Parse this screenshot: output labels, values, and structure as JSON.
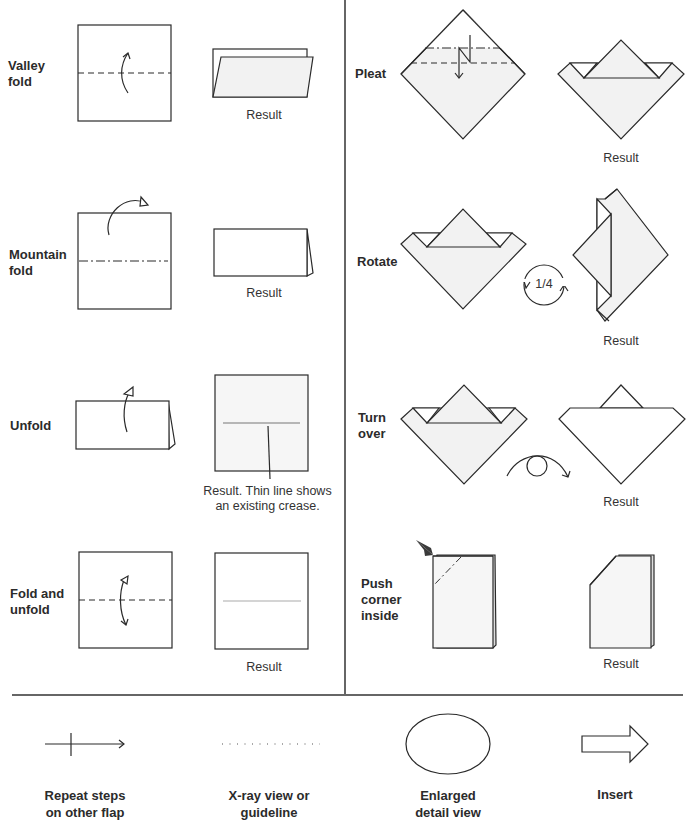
{
  "diagram": {
    "colors": {
      "ink": "#2a2a2a",
      "paper": "#ffffff",
      "colored_side": "#f2f2f2",
      "crease_line": "#aaaaaa",
      "divider": "#666666"
    },
    "left_column": [
      {
        "label": "Valley\nfold",
        "result": "Result"
      },
      {
        "label": "Mountain\nfold",
        "result": "Result"
      },
      {
        "label": "Unfold",
        "result": "Result. Thin line shows\nan existing crease."
      },
      {
        "label": "Fold and\nunfold",
        "result": "Result"
      }
    ],
    "right_column": [
      {
        "label": "Pleat",
        "result": "Result"
      },
      {
        "label": "Rotate",
        "result": "Result",
        "rotation": "1/4"
      },
      {
        "label": "Turn\nover",
        "result": "Result"
      },
      {
        "label": "Push\ncorner\ninside",
        "result": "Result"
      }
    ],
    "legend": [
      {
        "icon": "repeat-arrow-icon",
        "label": "Repeat steps\non other flap"
      },
      {
        "icon": "dotted-line-icon",
        "label": "X-ray view or\nguideline"
      },
      {
        "icon": "ellipse-icon",
        "label": "Enlarged\ndetail view"
      },
      {
        "icon": "hollow-arrow-icon",
        "label": "Insert"
      }
    ]
  }
}
